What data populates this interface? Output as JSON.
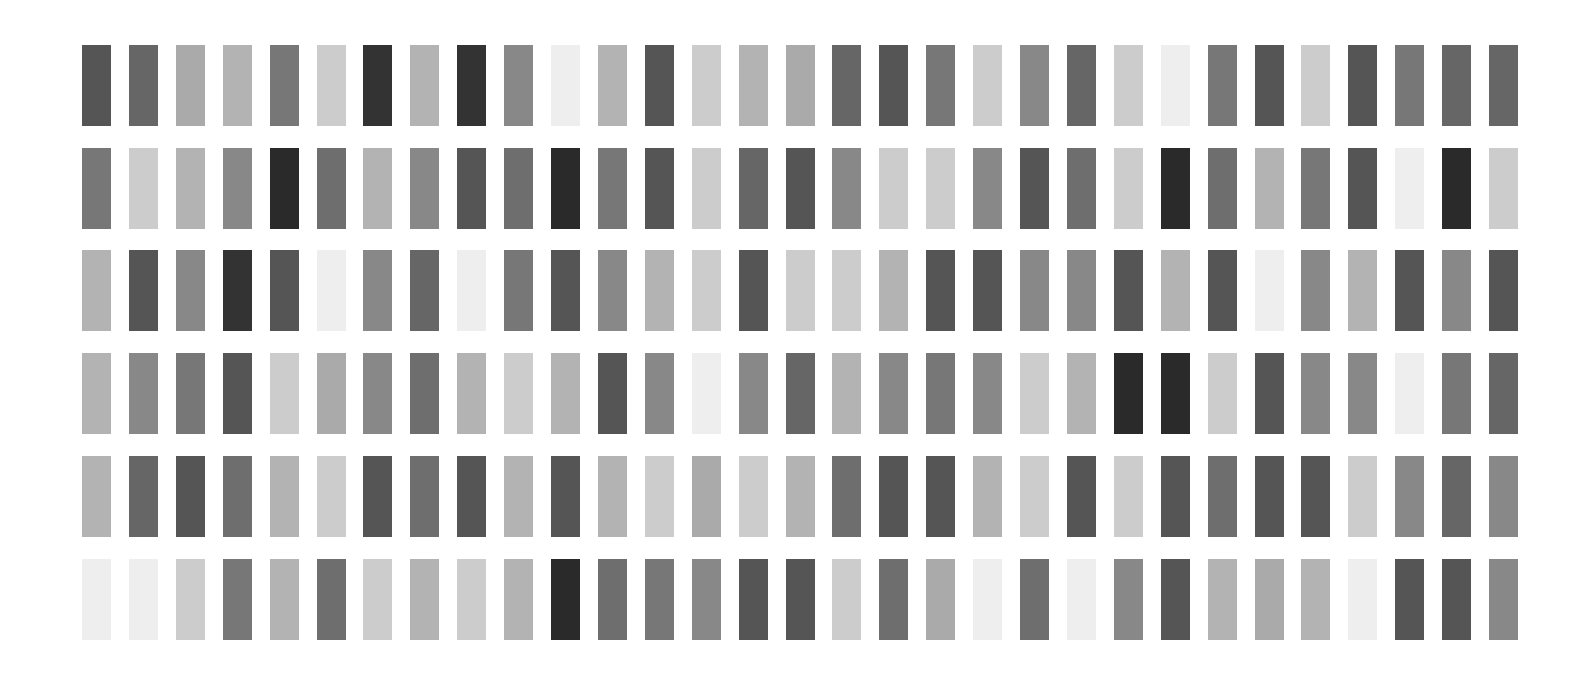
{
  "grid": {
    "rows": 6,
    "cols": 31,
    "origin_x": 82,
    "origin_y": 45,
    "col_pitch": 46.9,
    "row_pitch": 102.7,
    "swatch_width": 29,
    "swatch_height": 81,
    "background": "#ffffff",
    "cells": [
      [
        "#555555",
        "#666666",
        "#aaaaaa",
        "#b3b3b3",
        "#777777",
        "#cccccc",
        "#333333",
        "#b3b3b3",
        "#333333",
        "#888888",
        "#eeeeee",
        "#b3b3b3",
        "#555555",
        "#cccccc",
        "#b3b3b3",
        "#aaaaaa",
        "#666666",
        "#555555",
        "#777777",
        "#cccccc",
        "#888888",
        "#666666",
        "#cccccc",
        "#eeeeee",
        "#777777",
        "#555555",
        "#cccccc",
        "#555555",
        "#777777",
        "#666666",
        "#666666"
      ],
      [
        "#777777",
        "#cccccc",
        "#b3b3b3",
        "#888888",
        "#2a2a2a",
        "#6e6e6e",
        "#b3b3b3",
        "#888888",
        "#555555",
        "#6e6e6e",
        "#2a2a2a",
        "#777777",
        "#555555",
        "#cccccc",
        "#666666",
        "#555555",
        "#888888",
        "#cccccc",
        "#cccccc",
        "#888888",
        "#555555",
        "#6e6e6e",
        "#cccccc",
        "#2a2a2a",
        "#6e6e6e",
        "#b3b3b3",
        "#777777",
        "#555555",
        "#eeeeee",
        "#2a2a2a",
        "#cccccc"
      ],
      [
        "#b3b3b3",
        "#555555",
        "#888888",
        "#333333",
        "#555555",
        "#eeeeee",
        "#888888",
        "#666666",
        "#eeeeee",
        "#777777",
        "#555555",
        "#888888",
        "#b3b3b3",
        "#cccccc",
        "#555555",
        "#cccccc",
        "#cccccc",
        "#b3b3b3",
        "#555555",
        "#555555",
        "#888888",
        "#888888",
        "#555555",
        "#b3b3b3",
        "#555555",
        "#eeeeee",
        "#888888",
        "#b3b3b3",
        "#555555",
        "#888888",
        "#555555"
      ],
      [
        "#b3b3b3",
        "#888888",
        "#777777",
        "#555555",
        "#cccccc",
        "#aaaaaa",
        "#888888",
        "#6e6e6e",
        "#b3b3b3",
        "#cccccc",
        "#b3b3b3",
        "#555555",
        "#888888",
        "#eeeeee",
        "#888888",
        "#666666",
        "#b3b3b3",
        "#888888",
        "#777777",
        "#888888",
        "#cccccc",
        "#b3b3b3",
        "#2a2a2a",
        "#2a2a2a",
        "#cccccc",
        "#555555",
        "#888888",
        "#888888",
        "#eeeeee",
        "#777777",
        "#666666"
      ],
      [
        "#b3b3b3",
        "#666666",
        "#555555",
        "#6e6e6e",
        "#b3b3b3",
        "#cccccc",
        "#555555",
        "#6e6e6e",
        "#555555",
        "#b3b3b3",
        "#555555",
        "#b3b3b3",
        "#cccccc",
        "#aaaaaa",
        "#cccccc",
        "#b3b3b3",
        "#6e6e6e",
        "#555555",
        "#555555",
        "#b3b3b3",
        "#cccccc",
        "#555555",
        "#cccccc",
        "#555555",
        "#6e6e6e",
        "#555555",
        "#555555",
        "#cccccc",
        "#888888",
        "#666666",
        "#888888"
      ],
      [
        "#eeeeee",
        "#eeeeee",
        "#cccccc",
        "#777777",
        "#b3b3b3",
        "#6e6e6e",
        "#cccccc",
        "#b3b3b3",
        "#cccccc",
        "#b3b3b3",
        "#2a2a2a",
        "#6e6e6e",
        "#777777",
        "#888888",
        "#555555",
        "#555555",
        "#cccccc",
        "#6e6e6e",
        "#aaaaaa",
        "#eeeeee",
        "#6e6e6e",
        "#eeeeee",
        "#888888",
        "#555555",
        "#b3b3b3",
        "#aaaaaa",
        "#b3b3b3",
        "#eeeeee",
        "#555555",
        "#555555",
        "#888888"
      ]
    ]
  }
}
